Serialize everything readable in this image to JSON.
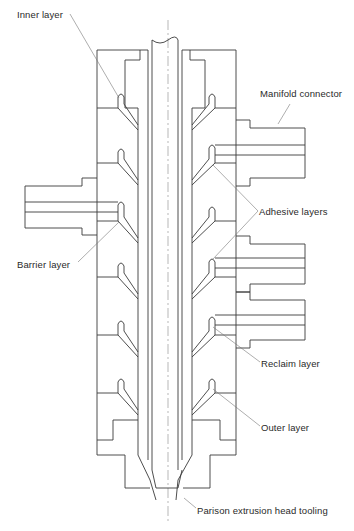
{
  "diagram": {
    "title": "Parison extrusion head tooling",
    "colors": {
      "line": "#3a3a3a",
      "leader": "#777777",
      "background": "#ffffff"
    },
    "labels": [
      {
        "id": "inner",
        "text": "Inner layer",
        "x": 17,
        "y": 9
      },
      {
        "id": "manifold",
        "text": "Manifold connector",
        "x": 260,
        "y": 88
      },
      {
        "id": "adhesive",
        "text": "Adhesive layers",
        "x": 259,
        "y": 206
      },
      {
        "id": "barrier",
        "text": "Barrier layer",
        "x": 17,
        "y": 259
      },
      {
        "id": "reclaim",
        "text": "Reclaim layer",
        "x": 261,
        "y": 358
      },
      {
        "id": "outer",
        "text": "Outer layer",
        "x": 261,
        "y": 422
      },
      {
        "id": "tooling",
        "text": "Parison extrusion head tooling",
        "x": 197,
        "y": 505
      }
    ]
  }
}
